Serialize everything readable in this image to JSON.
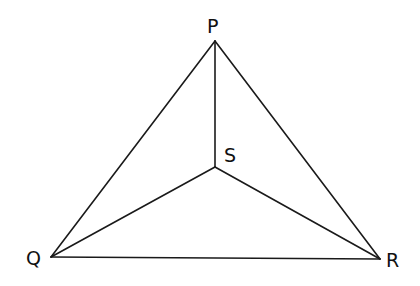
{
  "diagram": {
    "type": "triangle-with-interior-point",
    "stroke_color": "#1a1a1a",
    "points": {
      "P": {
        "label": "P",
        "x": 215,
        "y": 41,
        "label_x": 207,
        "label_y": 33
      },
      "Q": {
        "label": "Q",
        "x": 51,
        "y": 257,
        "label_x": 26,
        "label_y": 265
      },
      "R": {
        "label": "R",
        "x": 380,
        "y": 259,
        "label_x": 386,
        "label_y": 267
      },
      "S": {
        "label": "S",
        "x": 215,
        "y": 167,
        "label_x": 224,
        "label_y": 162
      }
    },
    "segments": [
      "PQ",
      "PR",
      "QR",
      "PS",
      "QS",
      "RS"
    ]
  }
}
